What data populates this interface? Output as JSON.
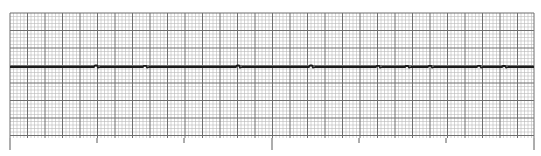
{
  "chart_data": {
    "type": "line",
    "title": "ECG rhythm strip",
    "subtitle": "",
    "xlabel": "",
    "ylabel": "",
    "grid": true,
    "legend": null,
    "colors": {
      "background": "#ffffff",
      "minor_grid": "#b8b8b8",
      "major_grid": "#6e6e6e",
      "trace": "#1a1a1a",
      "ticks": "#5a5a5a"
    },
    "layout": {
      "grid_left": 10,
      "grid_top": 13,
      "grid_right": 534,
      "grid_bottom": 138,
      "small_square_px": 3.5,
      "major_every": 5,
      "baseline_y": 67
    },
    "time_markers_x": [
      10,
      97,
      184,
      272,
      359,
      446,
      534
    ],
    "time_marker_long_index": [
      0,
      3,
      6
    ],
    "x": [
      10,
      96,
      145,
      238,
      311,
      378,
      407,
      430,
      479,
      504,
      534
    ],
    "series": [
      {
        "name": "Lead trace",
        "description": "Nearly flat isoelectric baseline with very small low-amplitude deflections",
        "blip_x": [
          96,
          145,
          238,
          311,
          378,
          407,
          430,
          479,
          504
        ],
        "blip_amplitude_px": [
          1.5,
          1.2,
          1.5,
          1.5,
          1.2,
          1.0,
          1.2,
          1.2,
          1.0
        ]
      }
    ]
  }
}
